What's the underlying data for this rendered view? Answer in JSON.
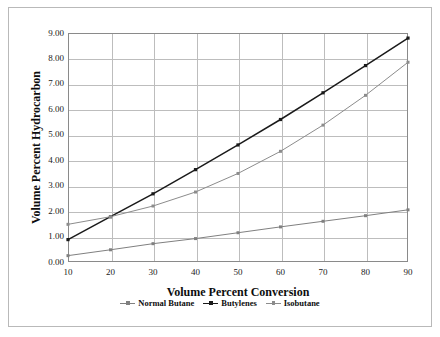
{
  "chart_data": {
    "type": "line",
    "title": "",
    "xlabel": "Volume Percent Conversion",
    "ylabel": "Volume Percent Hydrocarbon",
    "x": [
      10,
      20,
      30,
      40,
      50,
      60,
      70,
      80,
      90
    ],
    "xtick_labels": [
      "10",
      "20",
      "30",
      "40",
      "50",
      "60",
      "70",
      "80",
      "90"
    ],
    "ytick_labels": [
      "0.00",
      "1.00",
      "2.00",
      "3.00",
      "4.00",
      "5.00",
      "6.00",
      "7.00",
      "8.00",
      "9.00"
    ],
    "ytick_values": [
      0,
      1,
      2,
      3,
      4,
      5,
      6,
      7,
      8,
      9
    ],
    "xlim": [
      10,
      90
    ],
    "ylim": [
      0,
      9
    ],
    "grid": true,
    "legend_position": "bottom",
    "series": [
      {
        "name": "Normal Butane",
        "color": "#808080",
        "marker": "dot",
        "values": [
          0.25,
          0.48,
          0.72,
          0.92,
          1.15,
          1.38,
          1.6,
          1.82,
          2.05
        ]
      },
      {
        "name": "Butylenes",
        "color": "#1a1a1a",
        "marker": "dot",
        "values": [
          0.88,
          1.78,
          2.68,
          3.63,
          4.6,
          5.6,
          6.65,
          7.72,
          8.8
        ]
      },
      {
        "name": "Isobutane",
        "color": "#8c8c8c",
        "marker": "dot",
        "values": [
          1.48,
          1.78,
          2.2,
          2.75,
          3.48,
          4.35,
          5.38,
          6.55,
          7.85
        ]
      }
    ]
  },
  "legend": {
    "items": [
      {
        "label": "Normal Butane",
        "color": "#808080"
      },
      {
        "label": "Butylenes",
        "color": "#1a1a1a"
      },
      {
        "label": "Isobutane",
        "color": "#8c8c8c"
      }
    ]
  },
  "colors": {
    "grid": "#bdbdbd",
    "axis": "#8a8a8a",
    "background": "#ffffff",
    "frame": "#b9b9b9",
    "text": "#0d0d0d"
  }
}
